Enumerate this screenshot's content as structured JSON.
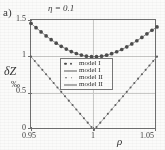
{
  "figure": {
    "panel_label": "a)",
    "y_axis_title": "δZ",
    "y_axis_units": "‰",
    "x_axis_title": "ρ"
  },
  "legend": {
    "entries": [
      {
        "label": "model Ι",
        "key": "two-dots"
      },
      {
        "label": "model Ι",
        "key": "line"
      },
      {
        "label": "model ΙΙ",
        "key": "two-small-dots"
      },
      {
        "label": "model ΙΙ",
        "key": "line"
      }
    ]
  },
  "chart_data": {
    "type": "line",
    "title": "η = 0.1",
    "xlabel": "ρ",
    "ylabel": "δZ ‰",
    "xlim": [
      0.95,
      1.05
    ],
    "ylim": [
      0,
      1.5
    ],
    "xticks": [
      "0.95",
      "1",
      "1.05"
    ],
    "xtick_values": [
      0.95,
      1.0,
      1.05
    ],
    "yticks": [
      "0",
      "0.5",
      "1",
      "1.5"
    ],
    "ytick_values": [
      0,
      0.5,
      1.0,
      1.5
    ],
    "grid": true,
    "legend_position": "center",
    "series": [
      {
        "name": "model Ι",
        "style": "markers-and-line",
        "marker": "filled-circle",
        "x": [
          0.95,
          0.954,
          0.958,
          0.962,
          0.966,
          0.97,
          0.974,
          0.978,
          0.982,
          0.986,
          0.99,
          0.994,
          0.998,
          1.002,
          1.006,
          1.01,
          1.014,
          1.018,
          1.022,
          1.026,
          1.03,
          1.034,
          1.038,
          1.042,
          1.046,
          1.05
        ],
        "y": [
          1.455,
          1.395,
          1.338,
          1.283,
          1.232,
          1.184,
          1.141,
          1.103,
          1.07,
          1.043,
          1.022,
          1.007,
          1.0,
          1.0,
          1.007,
          1.021,
          1.041,
          1.067,
          1.098,
          1.134,
          1.174,
          1.217,
          1.263,
          1.311,
          1.36,
          1.405
        ]
      },
      {
        "name": "model ΙΙ",
        "style": "markers-and-line",
        "marker": "small-dot",
        "x": [
          0.95,
          0.953,
          0.956,
          0.959,
          0.962,
          0.965,
          0.968,
          0.971,
          0.974,
          0.977,
          0.98,
          0.983,
          0.986,
          0.989,
          0.992,
          0.995,
          0.998,
          1.0,
          1.002,
          1.005,
          1.008,
          1.011,
          1.014,
          1.017,
          1.02,
          1.023,
          1.026,
          1.029,
          1.032,
          1.035,
          1.038,
          1.041,
          1.044,
          1.047,
          1.05
        ],
        "y": [
          1.0,
          0.94,
          0.88,
          0.82,
          0.76,
          0.7,
          0.64,
          0.58,
          0.52,
          0.46,
          0.4,
          0.34,
          0.28,
          0.22,
          0.16,
          0.1,
          0.04,
          0.0,
          0.04,
          0.1,
          0.16,
          0.22,
          0.28,
          0.34,
          0.4,
          0.46,
          0.52,
          0.58,
          0.64,
          0.7,
          0.76,
          0.82,
          0.88,
          0.94,
          1.0
        ]
      }
    ]
  }
}
